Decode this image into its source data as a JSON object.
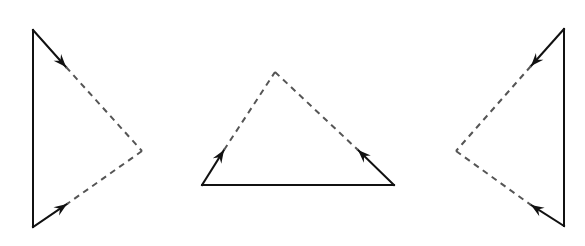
{
  "diagram": {
    "colors": {
      "solid": "#111111",
      "dashed": "#555555",
      "background": "#ffffff"
    },
    "triangles": [
      {
        "id": "left",
        "solid": [
          [
            33,
            30,
            33,
            227
          ],
          [
            33,
            30,
            66,
            67
          ],
          [
            33,
            227,
            67,
            204
          ]
        ],
        "dashed": [
          [
            66,
            67,
            142,
            151
          ],
          [
            142,
            151,
            67,
            204
          ]
        ],
        "arrows": [
          [
            33,
            30,
            66,
            67
          ],
          [
            33,
            227,
            67,
            204
          ]
        ]
      },
      {
        "id": "middle",
        "solid": [
          [
            202,
            185,
            394,
            185
          ],
          [
            202,
            185,
            224,
            150
          ],
          [
            394,
            185,
            358,
            150
          ]
        ],
        "dashed": [
          [
            224,
            150,
            275,
            72
          ],
          [
            275,
            72,
            358,
            150
          ]
        ],
        "arrows": [
          [
            202,
            185,
            224,
            150
          ],
          [
            394,
            185,
            358,
            150
          ]
        ]
      },
      {
        "id": "right",
        "solid": [
          [
            564,
            29,
            564,
            226
          ],
          [
            564,
            29,
            531,
            66
          ],
          [
            564,
            226,
            531,
            205
          ]
        ],
        "dashed": [
          [
            531,
            66,
            456,
            151
          ],
          [
            456,
            151,
            531,
            205
          ]
        ],
        "arrows": [
          [
            564,
            29,
            531,
            66
          ],
          [
            564,
            226,
            531,
            205
          ]
        ]
      }
    ]
  }
}
